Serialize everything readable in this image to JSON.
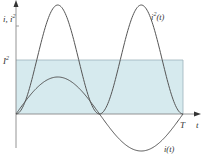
{
  "chart_data": {
    "type": "line",
    "title": "",
    "xlabel": "t",
    "ylabel": "i, i²",
    "x_ticks": [
      "T"
    ],
    "y_ticks": [
      "I²"
    ],
    "series": [
      {
        "name": "i²(t)",
        "description": "squared current, two positive humps per period, peak = 2·I²",
        "x": [
          0,
          0.25,
          0.5,
          0.75,
          1.0
        ],
        "values": [
          0,
          2,
          0,
          2,
          0
        ]
      },
      {
        "name": "i(t)",
        "description": "sinusoidal current over one period",
        "x": [
          0,
          0.25,
          0.5,
          0.75,
          1.0
        ],
        "values": [
          0,
          0.72,
          0,
          -0.72,
          0
        ]
      }
    ],
    "annotations": [
      "I² mean level (shaded rectangle from 0 to T)",
      "i²(t)",
      "i(t)",
      "T",
      "t"
    ],
    "colors": {
      "curves": "#555555",
      "axes": "#888888",
      "mean_line": "#9cb3bb",
      "shading": "#d6eaee"
    }
  },
  "labels": {
    "y_axis": "i, i²",
    "x_axis": "t",
    "period": "T",
    "mean_level": "I²",
    "i2_curve": "i²(t)",
    "i_curve": "i(t)"
  }
}
